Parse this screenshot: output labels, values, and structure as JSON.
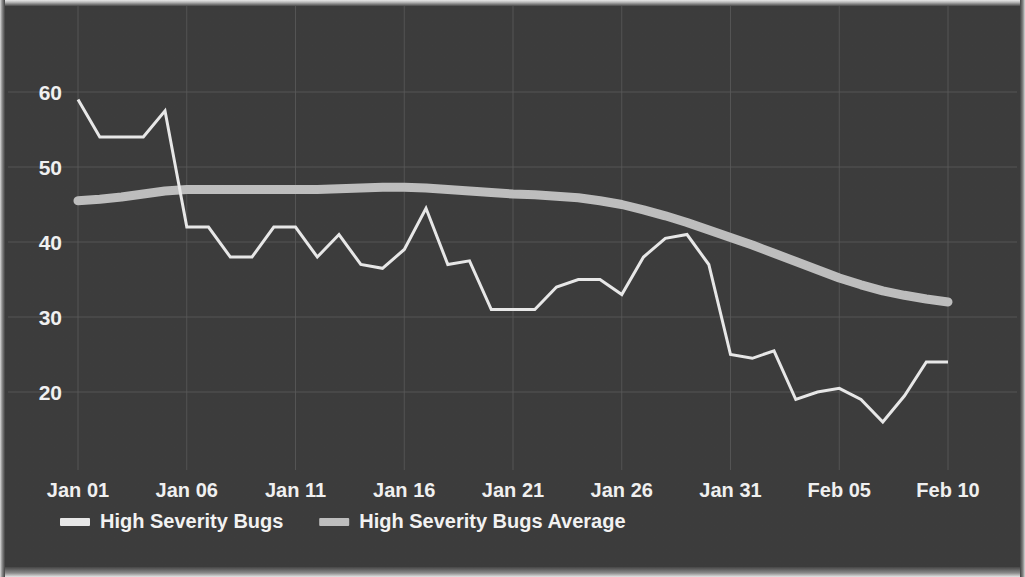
{
  "chart_data": {
    "type": "line",
    "title": "",
    "subtitle": "",
    "xlabel": "",
    "ylabel": "",
    "grid": true,
    "legend_position": "bottom-left",
    "x_tick_labels": [
      "Jan 01",
      "Jan 06",
      "Jan 11",
      "Jan 16",
      "Jan 21",
      "Jan 26",
      "Jan 31",
      "Feb 05",
      "Feb 10"
    ],
    "y_tick_labels": [
      "60",
      "50",
      "40",
      "30",
      "20"
    ],
    "y_tick_values": [
      60,
      50,
      40,
      30,
      20
    ],
    "ylim": [
      11,
      62
    ],
    "xlim": [
      "Jan 01",
      "Feb 10"
    ],
    "x": [
      "Jan 01",
      "Jan 02",
      "Jan 03",
      "Jan 04",
      "Jan 05",
      "Jan 06",
      "Jan 07",
      "Jan 08",
      "Jan 09",
      "Jan 10",
      "Jan 11",
      "Jan 12",
      "Jan 13",
      "Jan 14",
      "Jan 15",
      "Jan 16",
      "Jan 17",
      "Jan 18",
      "Jan 19",
      "Jan 20",
      "Jan 21",
      "Jan 22",
      "Jan 23",
      "Jan 24",
      "Jan 25",
      "Jan 26",
      "Jan 27",
      "Jan 28",
      "Jan 29",
      "Jan 30",
      "Jan 31",
      "Feb 01",
      "Feb 02",
      "Feb 03",
      "Feb 04",
      "Feb 05",
      "Feb 06",
      "Feb 07",
      "Feb 08",
      "Feb 09",
      "Feb 10"
    ],
    "series": [
      {
        "name": "High Severity Bugs",
        "color": "#e9e9e9",
        "line_width": 3,
        "values": [
          59,
          54,
          54,
          54,
          57.5,
          42,
          42,
          38,
          38,
          42,
          42,
          38,
          41,
          37,
          36.5,
          39,
          44.5,
          37,
          37.5,
          31,
          31,
          31,
          34,
          35,
          35,
          33,
          38,
          40.5,
          41,
          37,
          25,
          24.5,
          25.5,
          19,
          20,
          20.5,
          19,
          16,
          19.5,
          24,
          24
        ]
      },
      {
        "name": "High Severity Bugs Average",
        "color": "#bfbfbf",
        "line_width": 9,
        "values": [
          45.5,
          45.7,
          46,
          46.4,
          46.8,
          47,
          47,
          47,
          47,
          47,
          47,
          47,
          47.1,
          47.2,
          47.3,
          47.3,
          47.2,
          47,
          46.8,
          46.6,
          46.4,
          46.3,
          46.1,
          45.9,
          45.5,
          45,
          44.3,
          43.5,
          42.6,
          41.6,
          40.6,
          39.6,
          38.5,
          37.4,
          36.3,
          35.2,
          34.3,
          33.5,
          32.9,
          32.4,
          32
        ]
      }
    ],
    "legend": [
      {
        "label": "High Severity Bugs",
        "color": "#e9e9e9",
        "marker": "thick-line-swatch"
      },
      {
        "label": "High Severity Bugs Average",
        "color": "#bfbfbf",
        "marker": "thick-line-swatch"
      }
    ]
  },
  "theme": {
    "background": "#3c3c3c",
    "plot_background": "#3c3c3c",
    "grid_color": "#5a5a5a",
    "text_color": "#f2f2f2",
    "series_primary": "#e9e9e9",
    "series_average": "#bfbfbf"
  },
  "geometry": {
    "plot_left": 78,
    "plot_right": 948,
    "plot_top": 18,
    "plot_bottom": 465,
    "y_value_at_plot_top": 61.6,
    "y_value_at_plot_bottom": 2.0,
    "px_per_unit": 7.5,
    "y_pixel_of_60": 92,
    "legend_y": 524
  }
}
